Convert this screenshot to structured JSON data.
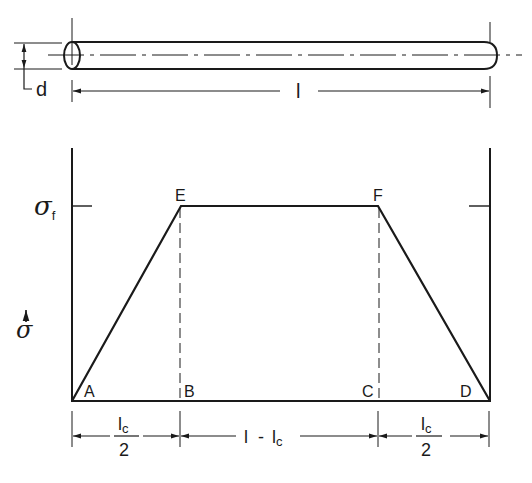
{
  "figure": {
    "colors": {
      "ink": "#1a1a1a",
      "background": "#ffffff"
    }
  },
  "fiber": {
    "diameter_label": "d",
    "length_label": "l"
  },
  "stress_plot": {
    "axis_label": "σ",
    "axis_arrow": "↑",
    "level_label": "σ",
    "level_subscript": "f",
    "points": {
      "A": "A",
      "B": "B",
      "C": "C",
      "D": "D",
      "E": "E",
      "F": "F"
    }
  },
  "dimensions": {
    "left_numerator": "l",
    "left_numerator_sub": "c",
    "left_denominator": "2",
    "middle_main": "l",
    "middle_dash": "-",
    "middle_sub_main": "l",
    "middle_sub": "c",
    "right_numerator": "l",
    "right_numerator_sub": "c",
    "right_denominator": "2"
  }
}
